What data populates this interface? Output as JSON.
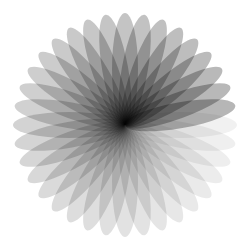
{
  "figure": {
    "center": [
      125,
      125
    ],
    "petal_count": 36,
    "petal_length": 112,
    "petal_width": 26,
    "fill_color": "#000000",
    "petal_opacity": 0.055,
    "background": "#ffffff"
  }
}
